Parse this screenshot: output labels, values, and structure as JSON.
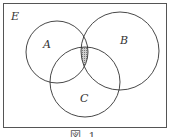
{
  "diagram": {
    "type": "venn",
    "universe_label": "E",
    "sets": [
      {
        "label": "A",
        "cx": 57,
        "cy": 52,
        "r": 31
      },
      {
        "label": "B",
        "cx": 120,
        "cy": 51,
        "r": 39
      },
      {
        "label": "C",
        "cx": 85,
        "cy": 82,
        "r": 35
      }
    ],
    "shaded_region": "A ∩ B ∩ C",
    "colors": {
      "stroke": "#333333",
      "shade": "#9a9a9a",
      "frame": "#555555"
    },
    "caption": "図 1"
  }
}
